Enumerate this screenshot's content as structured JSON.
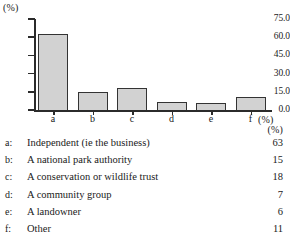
{
  "chart_data": {
    "type": "bar",
    "title": "",
    "xlabel": "(%)",
    "ylabel": "(%)",
    "categories": [
      "a",
      "b",
      "c",
      "d",
      "e",
      "f"
    ],
    "values": [
      63,
      15,
      18,
      7,
      6,
      11
    ],
    "ylim": [
      0,
      75
    ],
    "yticks": [
      0,
      15,
      30,
      45,
      60,
      75
    ],
    "ytick_labels": [
      "0.0",
      "15.0",
      "30.0",
      "45.0",
      "60.0",
      "75.0"
    ],
    "grid": false,
    "legend": "none",
    "bar_fill": "#d2d2d2",
    "bar_edge": "#333333",
    "axis_color": "#2b2b2b",
    "series": [
      {
        "name": "Percentage",
        "values": [
          63,
          15,
          18,
          7,
          6,
          11
        ]
      }
    ]
  },
  "axis_units": {
    "top_left": "(%)",
    "bottom_right": "(%)"
  },
  "legend_table": {
    "value_header": "(%)",
    "rows": [
      {
        "key": "a:",
        "description": "Independent (ie the business)",
        "value": "63"
      },
      {
        "key": "b:",
        "description": "A national park authority",
        "value": "15"
      },
      {
        "key": "c:",
        "description": "A conservation or wildlife trust",
        "value": "18"
      },
      {
        "key": "d:",
        "description": "A community group",
        "value": "7"
      },
      {
        "key": "e:",
        "description": "A landowner",
        "value": "6"
      },
      {
        "key": "f:",
        "description": "Other",
        "value": "11"
      }
    ]
  }
}
